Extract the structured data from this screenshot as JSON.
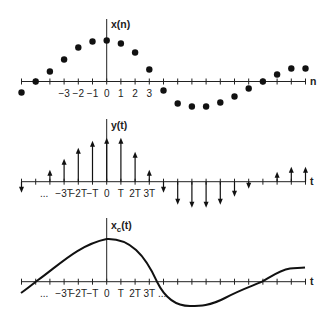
{
  "diagram": {
    "panels": [
      {
        "id": "discrete",
        "ylabel": "x(n)",
        "xlabel": "n",
        "tick_labels": [
          "−3",
          "−2",
          "−1",
          "0",
          "1",
          "2",
          "3"
        ],
        "tick_label_n": [
          -3,
          -2,
          -1,
          0,
          1,
          2,
          3
        ],
        "style": "dots",
        "samples": {
          "n": [
            -6,
            -5,
            -4,
            -3,
            -2,
            -1,
            0,
            1,
            2,
            3,
            4,
            5,
            6,
            7,
            8,
            9,
            10,
            11,
            12,
            13,
            14
          ],
          "values": [
            -11,
            0,
            10,
            22,
            34,
            40,
            41,
            38,
            29,
            12,
            -9,
            -22,
            -25,
            -25,
            -21,
            -15,
            -7,
            0,
            7,
            13,
            13
          ]
        }
      },
      {
        "id": "impulse",
        "ylabel": "y(t)",
        "xlabel": "t",
        "tick_labels": [
          "...",
          "−3T",
          "−2T",
          "−T",
          "0",
          "T",
          "2T",
          "3T"
        ],
        "tick_label_n": [
          -4.4,
          -3,
          -2,
          -1,
          0,
          1,
          2,
          3
        ],
        "style": "impulses",
        "samples": {
          "n": [
            -6,
            -5,
            -4,
            -3,
            -2,
            -1,
            0,
            1,
            2,
            3,
            4,
            5,
            6,
            7,
            8,
            9,
            10,
            11,
            12,
            13,
            14
          ],
          "values": [
            -11,
            0,
            12,
            23,
            34,
            41,
            44,
            44,
            30,
            12,
            -11,
            -23,
            -26,
            -26,
            -23,
            -15,
            -7,
            0,
            10,
            15,
            15
          ]
        }
      },
      {
        "id": "continuous",
        "ylabel": "x",
        "ylabel_sub": "c",
        "ylabel_suffix": "(t)",
        "xlabel": "t",
        "tick_labels": [
          "...",
          "−3T",
          "−2T",
          "−T",
          "0",
          "T",
          "2T",
          "3T",
          "..."
        ],
        "tick_label_n": [
          -4.4,
          -3,
          -2,
          -1,
          0,
          1,
          2,
          3,
          3.9
        ],
        "style": "curve"
      }
    ]
  }
}
